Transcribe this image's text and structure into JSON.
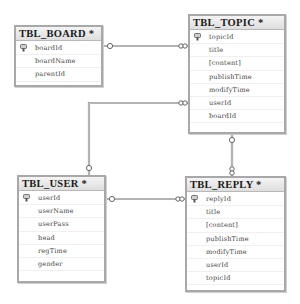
{
  "diagram": {
    "type": "database-schema",
    "tables": [
      {
        "id": "board",
        "title": "TBL_BOARD *",
        "columns": [
          {
            "name": "boardId",
            "primary_key": true
          },
          {
            "name": "boardName",
            "primary_key": false
          },
          {
            "name": "parentId",
            "primary_key": false
          }
        ]
      },
      {
        "id": "topic",
        "title": "TBL_TOPIC *",
        "columns": [
          {
            "name": "topicId",
            "primary_key": true
          },
          {
            "name": "title",
            "primary_key": false
          },
          {
            "name": "[content]",
            "primary_key": false
          },
          {
            "name": "publishTime",
            "primary_key": false
          },
          {
            "name": "modifyTime",
            "primary_key": false
          },
          {
            "name": "userId",
            "primary_key": false
          },
          {
            "name": "boardId",
            "primary_key": false
          }
        ]
      },
      {
        "id": "user",
        "title": "TBL_USER *",
        "columns": [
          {
            "name": "userId",
            "primary_key": true
          },
          {
            "name": "userName",
            "primary_key": false
          },
          {
            "name": "userPass",
            "primary_key": false
          },
          {
            "name": "head",
            "primary_key": false
          },
          {
            "name": "regTime",
            "primary_key": false
          },
          {
            "name": "gender",
            "primary_key": false
          }
        ]
      },
      {
        "id": "reply",
        "title": "TBL_REPLY *",
        "columns": [
          {
            "name": "replyId",
            "primary_key": true
          },
          {
            "name": "title",
            "primary_key": false
          },
          {
            "name": "[content]",
            "primary_key": false
          },
          {
            "name": "publishTime",
            "primary_key": false
          },
          {
            "name": "modifyTime",
            "primary_key": false
          },
          {
            "name": "userId",
            "primary_key": false
          },
          {
            "name": "topicId",
            "primary_key": false
          }
        ]
      }
    ],
    "relationships": [
      {
        "from": "TBL_BOARD",
        "to": "TBL_TOPIC",
        "one_end": "TBL_BOARD",
        "many_end": "TBL_TOPIC"
      },
      {
        "from": "TBL_USER",
        "to": "TBL_TOPIC",
        "one_end": "TBL_USER",
        "many_end": "TBL_TOPIC"
      },
      {
        "from": "TBL_TOPIC",
        "to": "TBL_REPLY",
        "one_end": "TBL_TOPIC",
        "many_end": "TBL_REPLY"
      },
      {
        "from": "TBL_USER",
        "to": "TBL_REPLY",
        "one_end": "TBL_USER",
        "many_end": "TBL_REPLY"
      }
    ],
    "colors": {
      "border": "#a8a8a8",
      "header_bg": "#e4e4e4",
      "link": "#888888"
    }
  }
}
